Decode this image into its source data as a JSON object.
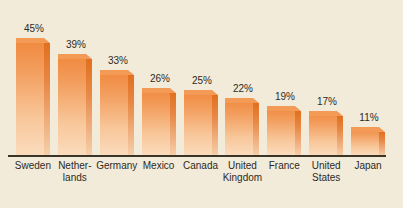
{
  "chart_data": {
    "type": "bar",
    "title": "",
    "xlabel": "",
    "ylabel": "",
    "ylim": [
      0,
      50
    ],
    "grid": false,
    "legend": false,
    "value_suffix": "%",
    "categories": [
      "Sweden",
      "Netherlands",
      "Germany",
      "Mexico",
      "Canada",
      "United Kingdom",
      "France",
      "United States",
      "Japan"
    ],
    "category_lines": [
      [
        "Sweden"
      ],
      [
        "Nether-",
        "lands"
      ],
      [
        "Germany"
      ],
      [
        "Mexico"
      ],
      [
        "Canada"
      ],
      [
        "United",
        "Kingdom"
      ],
      [
        "France"
      ],
      [
        "United",
        "States"
      ],
      [
        "Japan"
      ]
    ],
    "values": [
      45,
      39,
      33,
      26,
      25,
      22,
      19,
      17,
      11
    ],
    "value_labels": [
      "45%",
      "39%",
      "33%",
      "26%",
      "25%",
      "22%",
      "19%",
      "17%",
      "11%"
    ]
  },
  "colors": {
    "background": "#f2ebda",
    "bar_top_orange": "#f0873c",
    "bar_bottom_peach": "#fbdcbe",
    "bar_side_dark": "#e0701f",
    "axis": "#3b3528",
    "text": "#2e2a22"
  },
  "title_remnant": "· · ·"
}
